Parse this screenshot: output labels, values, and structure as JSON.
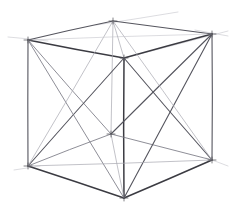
{
  "artwork": {
    "title": "Wireframe Cube Perspective Sketch",
    "medium": "pencil line drawing",
    "subject": "cube in two-point perspective with face diagonals",
    "background_color": "#ffffff",
    "line_color_dark": "#3b3b42",
    "line_color_mid": "#55555e",
    "line_color_light": "#7a7a84",
    "line_color_faint": "#a8a8b0",
    "canvas": {
      "width": 231,
      "height": 220
    }
  },
  "geometry": {
    "vertices": {
      "top_front": {
        "label": "top-front-apex",
        "x": 113,
        "y": 21
      },
      "top_left": {
        "label": "top-left",
        "x": 28,
        "y": 40
      },
      "top_right": {
        "label": "top-right",
        "x": 212,
        "y": 34
      },
      "top_back": {
        "label": "top-back-interior",
        "x": 124,
        "y": 58
      },
      "bottom_left": {
        "label": "bottom-left",
        "x": 28,
        "y": 166
      },
      "bottom_front": {
        "label": "bottom-front-apex",
        "x": 124,
        "y": 198
      },
      "bottom_right": {
        "label": "bottom-right",
        "x": 212,
        "y": 160
      },
      "bottom_back": {
        "label": "bottom-back-interior",
        "x": 111,
        "y": 134
      }
    },
    "edges": [
      {
        "name": "top-face-left-front",
        "from": "top_left",
        "to": "top_front",
        "weight": "medium"
      },
      {
        "name": "top-face-front-right",
        "from": "top_front",
        "to": "top_right",
        "weight": "medium"
      },
      {
        "name": "top-face-left-back",
        "from": "top_left",
        "to": "top_back",
        "weight": "strong"
      },
      {
        "name": "top-face-back-right",
        "from": "top_back",
        "to": "top_right",
        "weight": "strong"
      },
      {
        "name": "vertical-left",
        "from": "top_left",
        "to": "bottom_left",
        "weight": "medium"
      },
      {
        "name": "vertical-right",
        "from": "top_right",
        "to": "bottom_right",
        "weight": "medium"
      },
      {
        "name": "vertical-front",
        "from": "top_front",
        "to": "bottom_back",
        "weight": "faint"
      },
      {
        "name": "vertical-back-center",
        "from": "top_back",
        "to": "bottom_front",
        "weight": "strong"
      },
      {
        "name": "bottom-face-left-front",
        "from": "bottom_left",
        "to": "bottom_front",
        "weight": "strong"
      },
      {
        "name": "bottom-face-front-right",
        "from": "bottom_front",
        "to": "bottom_right",
        "weight": "strong"
      },
      {
        "name": "bottom-face-left-back",
        "from": "bottom_left",
        "to": "bottom_back",
        "weight": "light"
      },
      {
        "name": "bottom-face-back-right",
        "from": "bottom_back",
        "to": "bottom_right",
        "weight": "light"
      },
      {
        "name": "diag-left-face-a",
        "from": "top_left",
        "to": "bottom_back",
        "weight": "light"
      },
      {
        "name": "diag-left-face-b",
        "from": "bottom_left",
        "to": "top_back",
        "weight": "medium"
      },
      {
        "name": "diag-right-face-a",
        "from": "top_right",
        "to": "bottom_back",
        "weight": "medium"
      },
      {
        "name": "diag-right-face-b",
        "from": "bottom_right",
        "to": "top_back",
        "weight": "medium"
      },
      {
        "name": "diag-front-left-face-a",
        "from": "top_left",
        "to": "bottom_front",
        "weight": "light"
      },
      {
        "name": "diag-front-left-face-b",
        "from": "bottom_left",
        "to": "top_front",
        "weight": "faint"
      },
      {
        "name": "diag-front-right-face-a",
        "from": "top_right",
        "to": "bottom_front",
        "weight": "medium"
      },
      {
        "name": "diag-front-right-face-b",
        "from": "bottom_right",
        "to": "top_front",
        "weight": "faint"
      },
      {
        "name": "diag-top-face-a",
        "from": "top_left",
        "to": "top_right",
        "weight": "ghost"
      },
      {
        "name": "diag-top-face-b",
        "from": "top_front",
        "to": "top_back",
        "weight": "faint"
      },
      {
        "name": "diag-bottom-face-a",
        "from": "bottom_left",
        "to": "bottom_right",
        "weight": "faint"
      },
      {
        "name": "diag-bottom-face-b",
        "from": "bottom_front",
        "to": "bottom_back",
        "weight": "faint"
      }
    ],
    "construction_lines": [
      {
        "name": "vanishing-guide-top-left",
        "x1": 8,
        "y1": 37,
        "x2": 48,
        "y2": 41,
        "weight": "ghost"
      },
      {
        "name": "vanishing-guide-top-right",
        "x1": 195,
        "y1": 30,
        "x2": 228,
        "y2": 36,
        "weight": "ghost"
      },
      {
        "name": "vanishing-guide-apex",
        "x1": 96,
        "y1": 25,
        "x2": 178,
        "y2": 12,
        "weight": "ghost"
      },
      {
        "name": "vanishing-guide-bottom-right",
        "x1": 206,
        "y1": 158,
        "x2": 228,
        "y2": 166,
        "weight": "ghost"
      },
      {
        "name": "vanishing-guide-bottom-left",
        "x1": 14,
        "y1": 170,
        "x2": 40,
        "y2": 166,
        "weight": "ghost"
      },
      {
        "name": "overshoot-top-right-edge",
        "x1": 124,
        "y1": 58,
        "x2": 228,
        "y2": 31,
        "weight": "ghost"
      }
    ]
  }
}
